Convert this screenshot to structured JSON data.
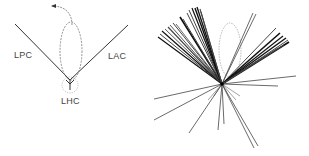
{
  "left_panel": {
    "labels": {
      "lpc": "LPC",
      "lac": "LAC",
      "lhc": "LHC"
    },
    "vertex": [
      70,
      80
    ],
    "lpc_line": [
      [
        15,
        24
      ],
      [
        70,
        80
      ]
    ],
    "lac_line": [
      [
        128,
        25
      ],
      [
        70,
        80
      ]
    ],
    "lhc_stem": [
      [
        70,
        80
      ],
      [
        70,
        90
      ]
    ],
    "loop": {
      "cx": 71,
      "cy": 51,
      "rx": 11,
      "ry": 29
    },
    "circle": {
      "cx": 70,
      "cy": 85,
      "r": 8
    },
    "arrow": {
      "path": "M72 25 C 72 12, 64 6, 52 6",
      "tip": [
        51,
        6
      ]
    }
  },
  "right_panel": {
    "center": [
      222,
      84
    ],
    "loop": {
      "cx": 230,
      "cy": 50,
      "rx": 11,
      "ry": 27
    },
    "rays": [
      [
        158,
        37,
        1.2
      ],
      [
        160,
        34,
        1.0
      ],
      [
        162,
        31,
        1.2
      ],
      [
        165,
        29,
        0.9
      ],
      [
        168,
        27,
        1.1
      ],
      [
        170,
        25,
        0.9
      ],
      [
        173,
        23,
        1.0
      ],
      [
        176,
        24,
        0.8
      ],
      [
        180,
        17,
        1.6
      ],
      [
        183,
        19,
        1.0
      ],
      [
        187,
        13,
        1.0
      ],
      [
        189,
        10,
        1.0
      ],
      [
        192,
        8,
        1.2
      ],
      [
        195,
        8,
        1.4
      ],
      [
        197,
        7,
        1.3
      ],
      [
        200,
        9,
        1.1
      ],
      [
        201,
        12,
        1.0
      ],
      [
        253,
        13,
        0.8
      ],
      [
        256,
        14,
        0.8
      ],
      [
        276,
        28,
        1.0
      ],
      [
        280,
        33,
        1.6
      ],
      [
        283,
        36,
        1.2
      ],
      [
        286,
        38,
        1.4
      ],
      [
        288,
        40,
        1.0
      ],
      [
        289,
        42,
        1.8
      ],
      [
        284,
        45,
        1.0
      ],
      [
        278,
        48,
        0.9
      ],
      [
        296,
        76,
        0.8
      ],
      [
        278,
        86,
        0.8
      ],
      [
        154,
        99,
        0.8
      ],
      [
        154,
        120,
        0.8
      ],
      [
        189,
        133,
        0.8
      ],
      [
        218,
        130,
        0.8
      ],
      [
        224,
        124,
        0.8
      ],
      [
        254,
        148,
        0.8
      ],
      [
        258,
        146,
        0.8
      ],
      [
        240,
        96,
        0.5
      ],
      [
        236,
        100,
        0.5
      ],
      [
        214,
        96,
        0.5
      ],
      [
        208,
        100,
        0.5
      ]
    ]
  }
}
